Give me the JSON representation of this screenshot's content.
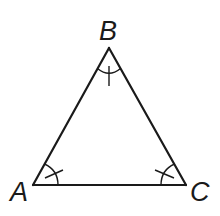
{
  "diagram": {
    "type": "equilateral-triangle",
    "vertices": [
      {
        "label": "A",
        "x": 33,
        "y": 185
      },
      {
        "label": "B",
        "x": 109,
        "y": 48
      },
      {
        "label": "C",
        "x": 186,
        "y": 185
      }
    ],
    "labels": {
      "a": "A",
      "b": "B",
      "c": "C"
    },
    "angle_marks": {
      "A": "single-arc-single-tick",
      "B": "single-arc-single-tick",
      "C": "single-arc-single-tick"
    },
    "colors": {
      "stroke": "#1a1a1a",
      "background": "#ffffff"
    }
  }
}
